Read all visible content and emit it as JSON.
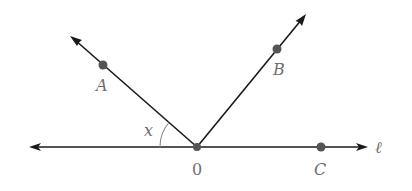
{
  "diagram": {
    "line_label": "ℓ",
    "angle_label": "x",
    "points": {
      "A": {
        "label": "A"
      },
      "B": {
        "label": "B"
      },
      "C": {
        "label": "C"
      },
      "O": {
        "label": "0"
      }
    },
    "colors": {
      "line": "#1a1a1a",
      "point": "#555555",
      "label": "#6e6e6e"
    }
  }
}
